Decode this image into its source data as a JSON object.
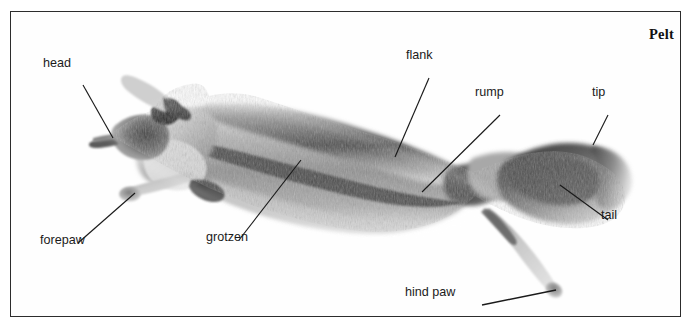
{
  "figure": {
    "title": "Pelt",
    "border_color": "#2c2c2c",
    "background_color": "#ffffff",
    "label_color": "#1b1b1b",
    "leader_line_color": "#1a1a1a"
  },
  "labels": [
    {
      "id": "head",
      "text": "head",
      "x": 43,
      "y": 58,
      "anchor_x": 98,
      "anchor_y": 124
    },
    {
      "id": "forepaw",
      "text": "forepaw",
      "x": 40,
      "y": 235,
      "anchor_x": 122,
      "anchor_y": 182
    },
    {
      "id": "grotzen",
      "text": "grotzen",
      "x": 206,
      "y": 232,
      "anchor_x": 288,
      "anchor_y": 150
    },
    {
      "id": "flank",
      "text": "flank",
      "x": 406,
      "y": 50,
      "anchor_x": 385,
      "anchor_y": 143
    },
    {
      "id": "rump",
      "text": "rump",
      "x": 475,
      "y": 87,
      "anchor_x": 412,
      "anchor_y": 179
    },
    {
      "id": "tip",
      "text": "tip",
      "x": 592,
      "y": 87,
      "anchor_x": 604,
      "anchor_y": 135
    },
    {
      "id": "tail",
      "text": "tail",
      "x": 601,
      "y": 210,
      "anchor_x": 548,
      "anchor_y": 175
    },
    {
      "id": "hind-paw",
      "text": "hind paw",
      "x": 405,
      "y": 287,
      "anchor_x": 545,
      "anchor_y": 279
    }
  ],
  "leader_lines": [
    {
      "id": "head-line",
      "x1": 72,
      "y1": 73,
      "x2": 102,
      "y2": 126
    },
    {
      "id": "forepaw-line",
      "x1": 67,
      "y1": 231,
      "x2": 124,
      "y2": 181
    },
    {
      "id": "grotzen-line",
      "x1": 228,
      "y1": 228,
      "x2": 290,
      "y2": 148
    },
    {
      "id": "flank-line",
      "x1": 418,
      "y1": 66,
      "x2": 384,
      "y2": 145
    },
    {
      "id": "rump-line",
      "x1": 489,
      "y1": 103,
      "x2": 411,
      "y2": 180
    },
    {
      "id": "tip-line",
      "x1": 597,
      "y1": 103,
      "x2": 582,
      "y2": 133
    },
    {
      "id": "tail-line",
      "x1": 597,
      "y1": 208,
      "x2": 549,
      "y2": 173
    },
    {
      "id": "hindpaw-line",
      "x1": 471,
      "y1": 293,
      "x2": 545,
      "y2": 278
    }
  ]
}
